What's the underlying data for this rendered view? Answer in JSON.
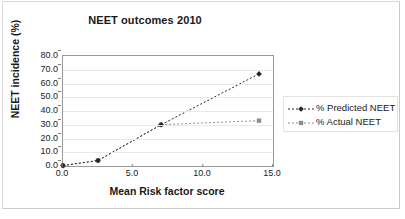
{
  "chart_data": {
    "type": "line",
    "title": "NEET outcomes 2010",
    "xlabel": "Mean Risk factor score",
    "ylabel": "NEET incidence (%)",
    "xlim": [
      0.0,
      15.0
    ],
    "ylim": [
      0.0,
      80.0
    ],
    "xticks": [
      "0.0",
      "5.0",
      "10.0",
      "15.0"
    ],
    "xtick_values": [
      0.0,
      5.0,
      10.0,
      15.0
    ],
    "yticks": [
      "0.0",
      "10.0",
      "20.0",
      "30.0",
      "40.0",
      "50.0",
      "60.0",
      "70.0",
      "80.0"
    ],
    "ytick_values": [
      0.0,
      10.0,
      20.0,
      30.0,
      40.0,
      50.0,
      60.0,
      70.0,
      80.0
    ],
    "grid": "horizontal",
    "legend_position": "right",
    "x": [
      0.0,
      2.5,
      7.0,
      14.0
    ],
    "series": [
      {
        "name": "% Predicted NEET",
        "values": [
          0.3,
          4.0,
          30.0,
          67.0
        ],
        "marker": "diamond",
        "linestyle": "dashed",
        "color": "#262626"
      },
      {
        "name": "% Actual NEET",
        "values": [
          0.3,
          4.0,
          30.0,
          33.0
        ],
        "marker": "square",
        "linestyle": "dashed",
        "color": "#8c8c8c"
      }
    ]
  },
  "legend": {
    "items": [
      {
        "label": "% Predicted NEET",
        "marker": "diamond-marker-icon"
      },
      {
        "label": "% Actual NEET",
        "marker": "square-marker-icon"
      }
    ]
  }
}
